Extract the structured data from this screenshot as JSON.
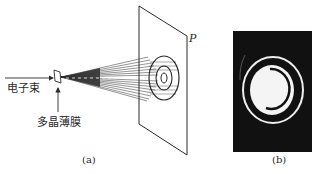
{
  "figure": {
    "panel_a": {
      "caption": "(a)",
      "beam_label": "电子束",
      "film_label": "多晶薄膜",
      "screen_label": "P"
    },
    "panel_b": {
      "caption": "(b)"
    }
  },
  "colors": {
    "line": "#2a2a2a",
    "photo_bg": "#111111",
    "ring": "#f2f2f2"
  }
}
